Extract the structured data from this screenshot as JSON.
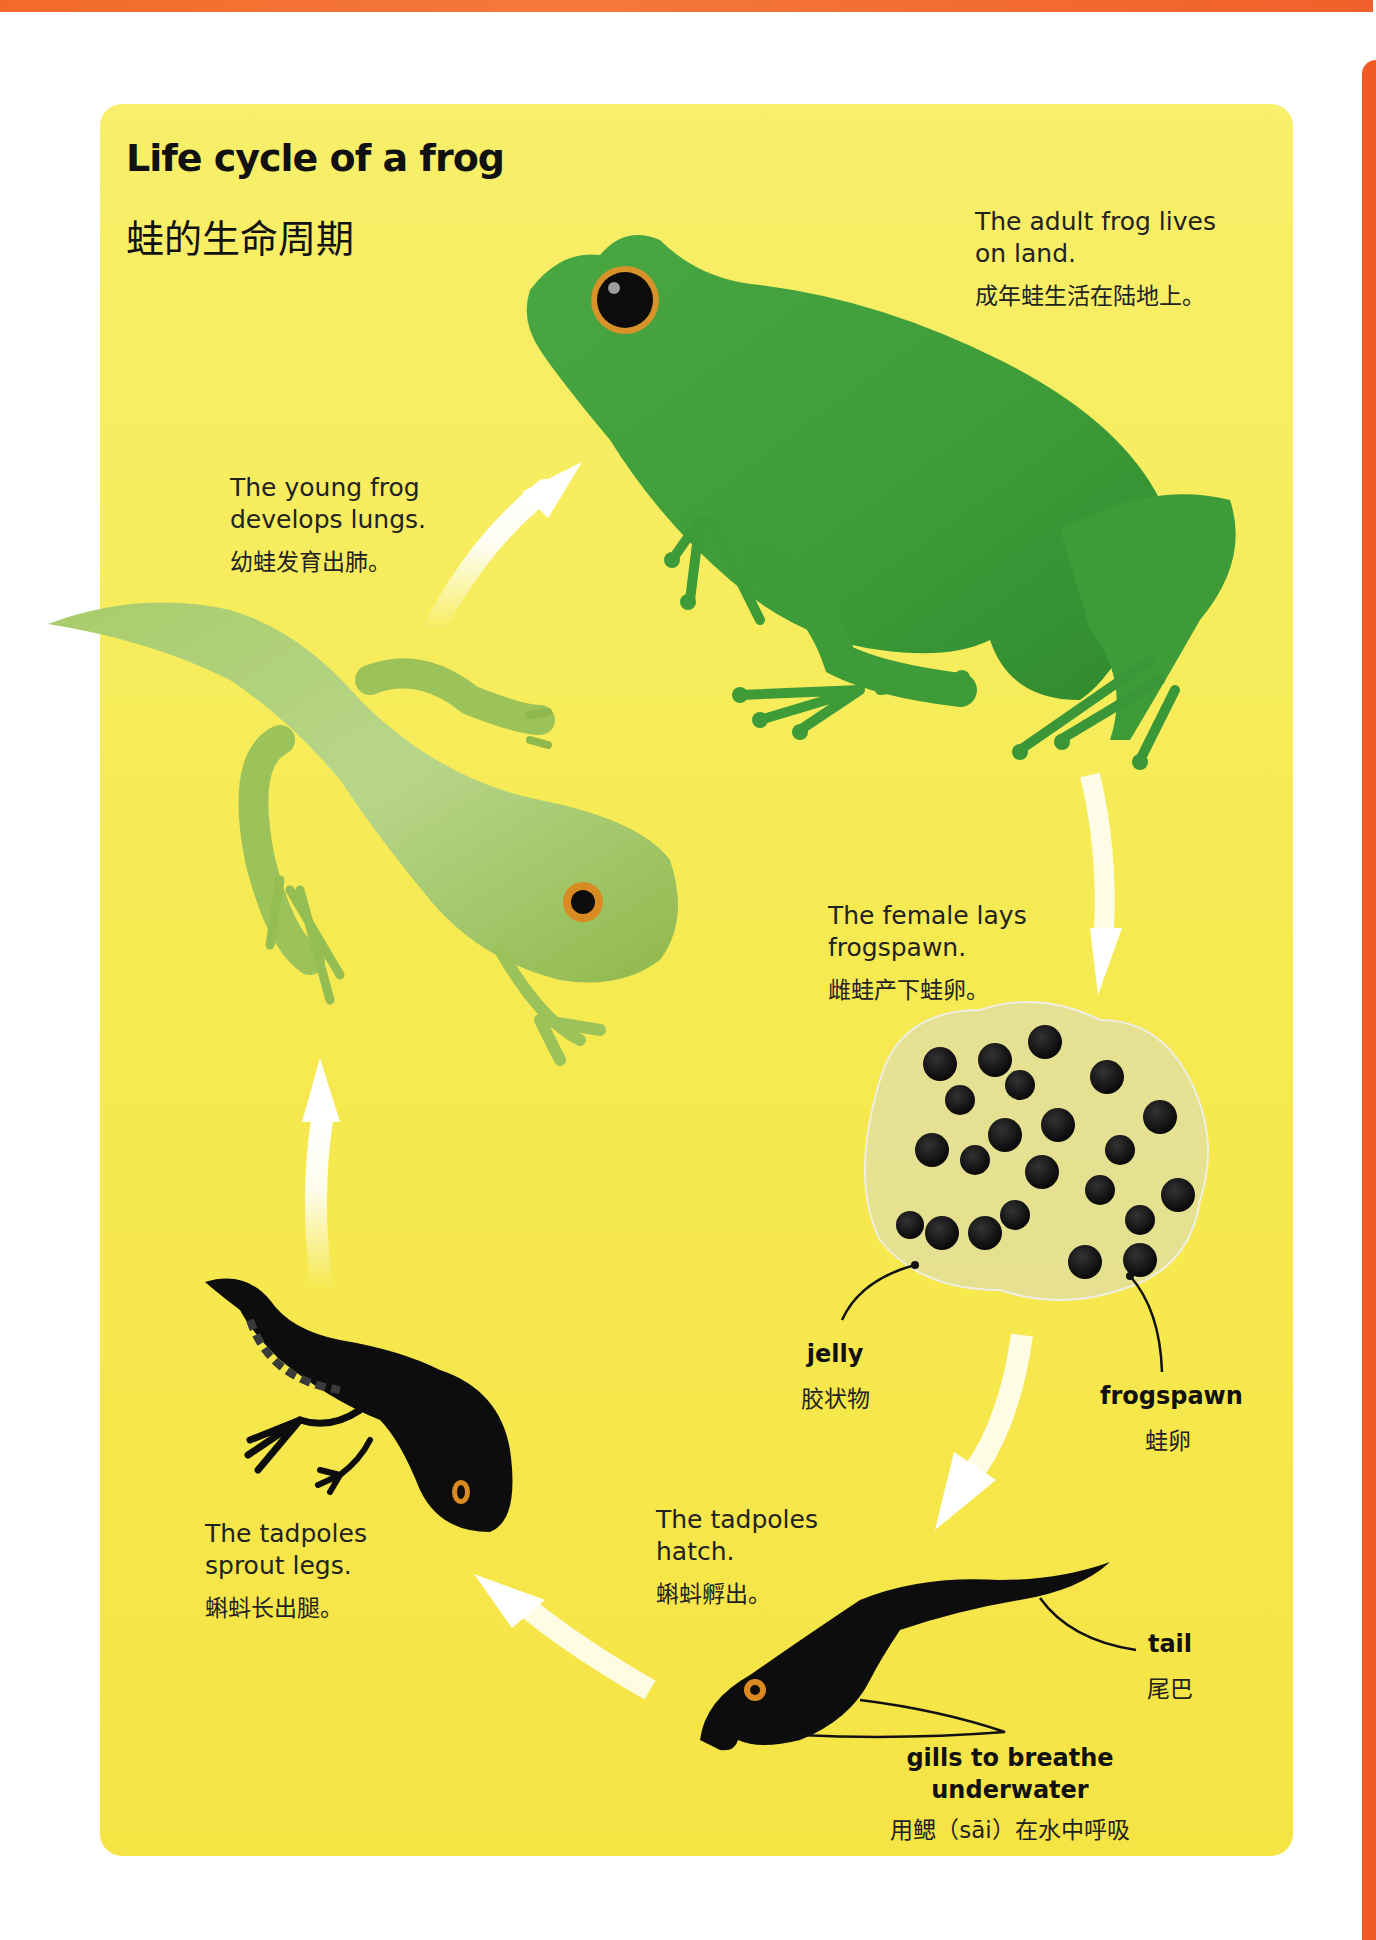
{
  "page": {
    "title_en": "Life cycle of a frog",
    "title_zh": "蛙的生命周期",
    "colors": {
      "panel_yellow": "#f6ea52",
      "accent_orange": "#f26a2a",
      "adult_frog_green": "#3f9e3a",
      "young_frog_green": "#9cc25a",
      "tadpole_black": "#0d0d0d",
      "arrow_white": "#ffffff",
      "eye_orange": "#d98a22"
    }
  },
  "stages": [
    {
      "id": "adult",
      "caption_en_1": "The adult frog lives",
      "caption_en_2": "on land.",
      "caption_zh": "成年蛙生活在陆地上。",
      "icon": "adult-frog-icon"
    },
    {
      "id": "frogspawn",
      "caption_en_1": "The female lays",
      "caption_en_2": "frogspawn.",
      "caption_zh": "雌蛙产下蛙卵。",
      "icon": "frogspawn-icon"
    },
    {
      "id": "hatch",
      "caption_en_1": "The tadpoles",
      "caption_en_2": "hatch.",
      "caption_zh": "蝌蚪孵出。",
      "icon": "tadpole-icon"
    },
    {
      "id": "legs",
      "caption_en_1": "The tadpoles",
      "caption_en_2": "sprout legs.",
      "caption_zh": "蝌蚪长出腿。",
      "icon": "legged-tadpole-icon"
    },
    {
      "id": "young",
      "caption_en_1": "The young frog",
      "caption_en_2": "develops lungs.",
      "caption_zh": "幼蛙发育出肺。",
      "icon": "young-frog-icon"
    }
  ],
  "labels": {
    "jelly": {
      "en": "jelly",
      "zh": "胶状物"
    },
    "frogspawn": {
      "en": "frogspawn",
      "zh": "蛙卵"
    },
    "tail": {
      "en": "tail",
      "zh": "尾巴"
    },
    "gills": {
      "en_1": "gills to breathe",
      "en_2": "underwater",
      "zh": "用鳃（sāi）在水中呼吸"
    }
  },
  "arrows": [
    "young-to-adult",
    "adult-to-frogspawn",
    "frogspawn-to-hatch",
    "hatch-to-legs",
    "legs-to-young"
  ]
}
